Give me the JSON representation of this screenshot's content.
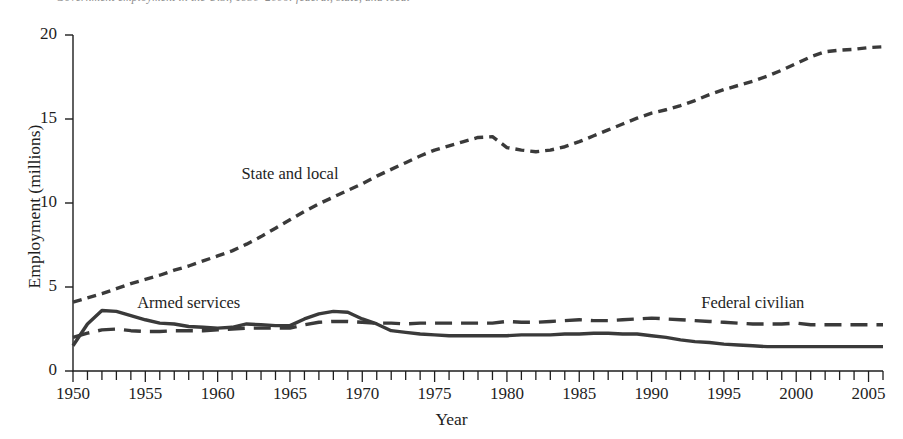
{
  "caption": {
    "text": "Government employment in the U.S., 1950–2006: federal, state, and local",
    "note": "clipped-top-caption"
  },
  "chart_data": {
    "type": "line",
    "title": "",
    "xlabel": "Year",
    "ylabel": "Employment (millions)",
    "xlim": [
      1950,
      2006
    ],
    "ylim": [
      0,
      20
    ],
    "grid": false,
    "legend": "inline-annotations",
    "xticks": [
      1950,
      1955,
      1960,
      1965,
      1970,
      1975,
      1980,
      1985,
      1990,
      1995,
      2000,
      2005
    ],
    "xtick_labels": [
      "1950",
      "1955",
      "1960",
      "1965",
      "1970",
      "1975",
      "1980",
      "1985",
      "1990",
      "1995",
      "2000",
      "2005"
    ],
    "minor_xtick_interval": 1,
    "yticks": [
      0,
      5,
      10,
      15,
      20
    ],
    "ytick_labels": [
      "0",
      "5",
      "10",
      "15",
      "20"
    ],
    "x": [
      1950,
      1951,
      1952,
      1953,
      1954,
      1955,
      1956,
      1957,
      1958,
      1959,
      1960,
      1961,
      1962,
      1963,
      1964,
      1965,
      1966,
      1967,
      1968,
      1969,
      1970,
      1971,
      1972,
      1973,
      1974,
      1975,
      1976,
      1977,
      1978,
      1979,
      1980,
      1981,
      1982,
      1983,
      1984,
      1985,
      1986,
      1987,
      1988,
      1989,
      1990,
      1991,
      1992,
      1993,
      1994,
      1995,
      1996,
      1997,
      1998,
      1999,
      2000,
      2001,
      2002,
      2003,
      2004,
      2005,
      2006
    ],
    "series": [
      {
        "name": "State and local",
        "style": "short-dashed",
        "color": "#3a3a3a",
        "label_x": 1965,
        "label_y": 11.6,
        "values": [
          4.1,
          4.35,
          4.6,
          4.9,
          5.2,
          5.45,
          5.7,
          6.0,
          6.25,
          6.55,
          6.85,
          7.15,
          7.55,
          8.0,
          8.5,
          9.0,
          9.5,
          9.95,
          10.35,
          10.75,
          11.15,
          11.6,
          12.0,
          12.4,
          12.8,
          13.15,
          13.4,
          13.65,
          13.9,
          13.95,
          13.3,
          13.15,
          13.05,
          13.15,
          13.35,
          13.65,
          14.0,
          14.35,
          14.7,
          15.05,
          15.35,
          15.55,
          15.8,
          16.1,
          16.45,
          16.75,
          17.0,
          17.25,
          17.55,
          17.9,
          18.3,
          18.7,
          19.0,
          19.1,
          19.15,
          19.25,
          19.3
        ]
      },
      {
        "name": "Federal civilian",
        "style": "long-dashed",
        "color": "#3a3a3a",
        "label_x": 1997,
        "label_y": 3.95,
        "values": [
          2.0,
          2.25,
          2.45,
          2.5,
          2.4,
          2.35,
          2.35,
          2.4,
          2.4,
          2.4,
          2.45,
          2.5,
          2.55,
          2.55,
          2.55,
          2.55,
          2.75,
          2.9,
          2.95,
          2.95,
          2.9,
          2.85,
          2.85,
          2.8,
          2.85,
          2.85,
          2.85,
          2.85,
          2.85,
          2.85,
          2.95,
          2.9,
          2.9,
          2.95,
          3.0,
          3.05,
          3.0,
          3.0,
          3.05,
          3.1,
          3.15,
          3.1,
          3.05,
          3.0,
          2.95,
          2.9,
          2.85,
          2.8,
          2.8,
          2.8,
          2.85,
          2.75,
          2.75,
          2.75,
          2.75,
          2.75,
          2.75
        ]
      },
      {
        "name": "Armed services",
        "style": "solid",
        "color": "#3a3a3a",
        "label_x": 1958,
        "label_y": 3.95,
        "values": [
          1.5,
          2.8,
          3.6,
          3.55,
          3.3,
          3.05,
          2.85,
          2.8,
          2.65,
          2.6,
          2.55,
          2.6,
          2.8,
          2.75,
          2.7,
          2.7,
          3.1,
          3.4,
          3.55,
          3.5,
          3.1,
          2.8,
          2.4,
          2.3,
          2.2,
          2.15,
          2.1,
          2.1,
          2.1,
          2.1,
          2.1,
          2.15,
          2.15,
          2.15,
          2.2,
          2.2,
          2.25,
          2.25,
          2.2,
          2.2,
          2.1,
          2.0,
          1.85,
          1.75,
          1.7,
          1.6,
          1.55,
          1.5,
          1.45,
          1.45,
          1.45,
          1.45,
          1.45,
          1.45,
          1.45,
          1.45,
          1.45
        ]
      }
    ]
  },
  "colors": {
    "line": "#3a3a3a",
    "axis": "#1e1e1e",
    "text": "#1e1e1e",
    "caption": "#8d8d8d",
    "background": "#ffffff"
  },
  "geometry": {
    "plot_left": 73,
    "plot_right": 883,
    "plot_top": 35,
    "plot_bottom": 371
  }
}
